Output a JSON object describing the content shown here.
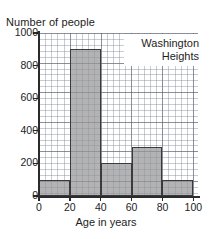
{
  "chart_data": {
    "type": "bar",
    "title": "",
    "subtitle": "",
    "xlabel": "Age in years",
    "ylabel": "Number of people",
    "categories": [
      "0-20",
      "20-40",
      "40-60",
      "60-80",
      "80-100"
    ],
    "bin_edges": [
      0,
      20,
      40,
      60,
      80,
      100
    ],
    "values": [
      100,
      900,
      200,
      300,
      100
    ],
    "series": [
      {
        "name": "Washington Heights",
        "values": [
          100,
          900,
          200,
          300,
          100
        ]
      }
    ],
    "xlim": [
      0,
      100
    ],
    "ylim": [
      0,
      1000
    ],
    "x_ticks": [
      0,
      20,
      40,
      60,
      80,
      100
    ],
    "y_ticks": [
      0,
      200,
      400,
      600,
      800,
      1000
    ],
    "x_tick_labels": [
      "0",
      "20",
      "40",
      "60",
      "80",
      "100"
    ],
    "y_tick_labels": [
      "0",
      "200",
      "400",
      "600",
      "800",
      "1000"
    ],
    "x_minor_step": 4,
    "y_minor_step": 40,
    "grid": true,
    "grid_style": "fine graph-paper grid, major lines at ticks",
    "legend": {
      "position": "top-right",
      "lines": [
        "Washington",
        "Heights"
      ],
      "text": "Washington Heights"
    },
    "colors": {
      "bar_fill": "#969698",
      "bar_outline": "#3a3a3a",
      "axis": "#2b2b2b",
      "major_grid": "#5a5f6e",
      "minor_grid": "#7880 91",
      "background": "#ffffff",
      "text": "#1d1d1d"
    }
  }
}
